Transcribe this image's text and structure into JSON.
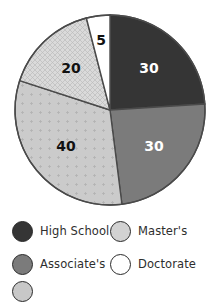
{
  "chart_data": {
    "type": "pie",
    "title": "",
    "categories": [
      "High School",
      "Associate's",
      "Bachelor's",
      "Master's",
      "Doctorate"
    ],
    "values": [
      30,
      30,
      40,
      20,
      5
    ],
    "colors": [
      "#353535",
      "#7b7b7b",
      "#cbcbcb",
      "#d8d8d8",
      "#ffffff"
    ],
    "patterns": [
      "solid",
      "solid",
      "dots",
      "crosshatch",
      "solid"
    ],
    "label_colors": [
      "#ffffff",
      "#ffffff",
      "#111111",
      "#111111",
      "#111111"
    ],
    "start_angle_deg": 0,
    "direction": "clockwise",
    "legend": {
      "position": "bottom",
      "entries": [
        {
          "label": "High School",
          "color": "#353535"
        },
        {
          "label": "Master's",
          "color": "#d8d8d8"
        },
        {
          "label": "Associate's",
          "color": "#7b7b7b"
        },
        {
          "label": "Doctorate",
          "color": "#ffffff"
        }
      ]
    }
  }
}
